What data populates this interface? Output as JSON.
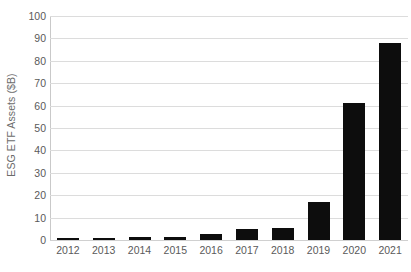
{
  "chart_data": {
    "type": "bar",
    "title": "",
    "xlabel": "",
    "ylabel": "ESG ETF Assets ($B)",
    "categories": [
      "2012",
      "2013",
      "2014",
      "2015",
      "2016",
      "2017",
      "2018",
      "2019",
      "2020",
      "2021"
    ],
    "values": [
      0.7,
      1.0,
      1.4,
      1.5,
      2.5,
      5.0,
      5.5,
      17.0,
      61.0,
      88.0
    ],
    "ylim": [
      0,
      100
    ],
    "ytick_labels": [
      "100",
      "90",
      "80",
      "70",
      "60",
      "50",
      "40",
      "30",
      "20",
      "10",
      "0"
    ],
    "ytick_values": [
      100,
      90,
      80,
      70,
      60,
      50,
      40,
      30,
      20,
      10,
      0
    ],
    "ytick_step": 10,
    "grid": true,
    "grid_axis": "y",
    "legend": false,
    "legend_position": "none",
    "bar_color": "#0d0d0d",
    "grid_color": "#dcdcdc",
    "axis_color": "#c9c9c9",
    "tick_label_color": "#5a5a5a",
    "axis_title_color": "#6b6b6b",
    "background_color": "#ffffff"
  }
}
